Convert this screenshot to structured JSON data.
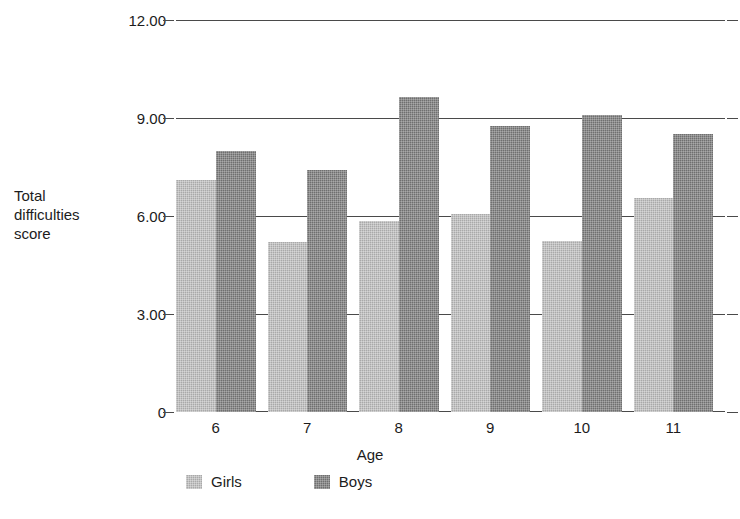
{
  "chart_data": {
    "type": "bar",
    "title": "",
    "xlabel": "Age",
    "ylabel": "Total\ndifficulties\nscore",
    "categories": [
      "6",
      "7",
      "8",
      "9",
      "10",
      "11"
    ],
    "series": [
      {
        "name": "Girls",
        "color": "#a9a9a9",
        "values": [
          7.1,
          5.2,
          5.85,
          6.05,
          5.25,
          6.55
        ]
      },
      {
        "name": "Boys",
        "color": "#6f6f6f",
        "values": [
          8.0,
          7.4,
          9.65,
          8.75,
          9.1,
          8.5
        ]
      }
    ],
    "ylim": [
      0,
      12
    ],
    "y_ticks": [
      "0",
      "3.00",
      "6.00",
      "9.00",
      "12.00"
    ],
    "y_tick_values": [
      0,
      3,
      6,
      9,
      12
    ],
    "grid": true,
    "legend_position": "bottom-left"
  },
  "legend": {
    "items": [
      {
        "label": "Girls"
      },
      {
        "label": "Boys"
      }
    ]
  },
  "caption": ""
}
